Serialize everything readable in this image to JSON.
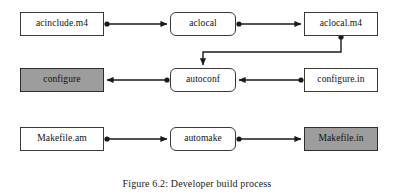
{
  "figure": {
    "caption": "Figure 6.2: Developer build process",
    "colors": {
      "background": "#ffffff",
      "box_fill": "#ffffff",
      "box_shaded_fill": "#9d9d9d",
      "box_stroke": "#3a3a3a",
      "connector": "#1a1a1a",
      "text": "#111111"
    }
  },
  "nodes": [
    {
      "id": "acinclude-m4",
      "label": "acinclude.m4",
      "shape": "rect",
      "shaded": false,
      "x": 20,
      "y": 12,
      "w": 84,
      "h": 24
    },
    {
      "id": "aclocal",
      "label": "aclocal",
      "shape": "rounded",
      "shaded": false,
      "x": 170,
      "y": 12,
      "w": 66,
      "h": 24
    },
    {
      "id": "aclocal-m4",
      "label": "aclocal.m4",
      "shape": "rect",
      "shaded": false,
      "x": 304,
      "y": 12,
      "w": 74,
      "h": 24
    },
    {
      "id": "configure",
      "label": "configure",
      "shape": "rect",
      "shaded": true,
      "x": 20,
      "y": 68,
      "w": 84,
      "h": 24
    },
    {
      "id": "autoconf",
      "label": "autoconf",
      "shape": "rounded",
      "shaded": false,
      "x": 170,
      "y": 68,
      "w": 66,
      "h": 24
    },
    {
      "id": "configure-in",
      "label": "configure.in",
      "shape": "rect",
      "shaded": false,
      "x": 304,
      "y": 68,
      "w": 74,
      "h": 24
    },
    {
      "id": "makefile-am",
      "label": "Makefile.am",
      "shape": "rect",
      "shaded": false,
      "x": 20,
      "y": 127,
      "w": 84,
      "h": 24
    },
    {
      "id": "automake",
      "label": "automake",
      "shape": "rounded",
      "shaded": false,
      "x": 170,
      "y": 127,
      "w": 66,
      "h": 24
    },
    {
      "id": "makefile-in",
      "label": "Makefile.in",
      "shape": "rect",
      "shaded": true,
      "x": 304,
      "y": 127,
      "w": 74,
      "h": 24
    }
  ],
  "edges": [
    {
      "id": "acinclude-to-aclocal",
      "from": "acinclude.m4",
      "to": "aclocal",
      "style": "straight",
      "source_dot": true,
      "arrowhead": true
    },
    {
      "id": "aclocal-to-aclocal-m4",
      "from": "aclocal",
      "to": "aclocal.m4",
      "style": "straight",
      "source_dot": true,
      "arrowhead": true
    },
    {
      "id": "aclocal-m4-to-autoconf",
      "from": "aclocal.m4",
      "to": "autoconf",
      "style": "elbow",
      "source_dot": true,
      "arrowhead": true
    },
    {
      "id": "configure-in-to-autoconf",
      "from": "configure.in",
      "to": "autoconf",
      "style": "straight",
      "source_dot": true,
      "arrowhead": true
    },
    {
      "id": "autoconf-to-configure",
      "from": "autoconf",
      "to": "configure",
      "style": "straight",
      "source_dot": true,
      "arrowhead": true
    },
    {
      "id": "makefile-am-to-automake",
      "from": "Makefile.am",
      "to": "automake",
      "style": "straight",
      "source_dot": true,
      "arrowhead": true
    },
    {
      "id": "automake-to-makefile-in",
      "from": "automake",
      "to": "Makefile.in",
      "style": "straight",
      "source_dot": true,
      "arrowhead": true
    }
  ]
}
